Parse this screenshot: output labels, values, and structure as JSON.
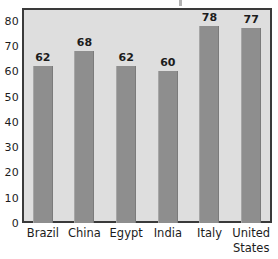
{
  "chart_data": {
    "type": "bar",
    "title": "",
    "subtitle": "",
    "xlabel": "",
    "ylabel": "",
    "categories": [
      "Brazil",
      "China",
      "Egypt",
      "India",
      "Italy",
      "United States"
    ],
    "category_lines": [
      [
        "Brazil"
      ],
      [
        "China"
      ],
      [
        "Egypt"
      ],
      [
        "India"
      ],
      [
        "Italy"
      ],
      [
        "United",
        "States"
      ]
    ],
    "values": [
      62,
      68,
      62,
      60,
      78,
      77
    ],
    "value_labels": [
      "62",
      "68",
      "62",
      "60",
      "78",
      "77"
    ],
    "ylim": [
      0,
      85
    ],
    "yticks": [
      0,
      10,
      20,
      30,
      40,
      50,
      60,
      70,
      80
    ],
    "ytick_labels": [
      "0",
      "10",
      "20",
      "30",
      "40",
      "50",
      "60",
      "70",
      "80"
    ],
    "grid": false,
    "legend": null,
    "legend_position": "none",
    "colors": {
      "bar_fill": "#8e8e8e",
      "plot_background": "#dedede",
      "frame": "#3a3a3a",
      "text": "#1c1c1c",
      "page_background": "#ffffff"
    }
  }
}
